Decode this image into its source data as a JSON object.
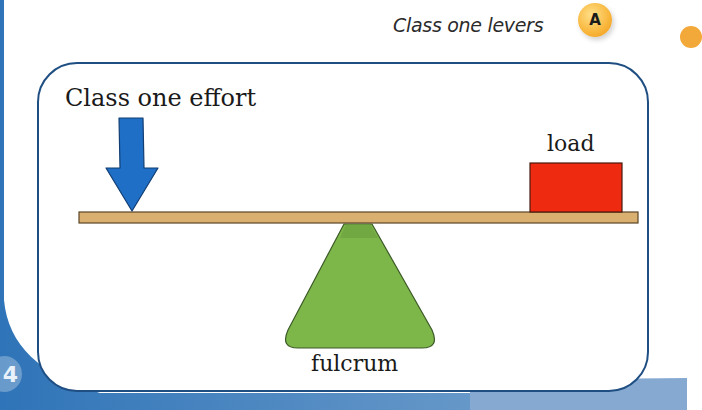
{
  "page": {
    "heading": "Class one levers",
    "section_badge": "A",
    "page_number": "4"
  },
  "diagram": {
    "title": "Class one lever",
    "labels": {
      "effort": "Class one effort",
      "load": "load",
      "fulcrum": "fulcrum"
    },
    "colors": {
      "panel_border": "#1f4f82",
      "page_blue": "#3a7dbf",
      "effort_arrow": "#1f6fc7",
      "lever_plank": "#d9b070",
      "load_box": "#ee2a10",
      "fulcrum": "#7db74a",
      "badge": "#f8b53a"
    },
    "components": [
      {
        "name": "effort arrow",
        "direction": "down",
        "position": "left end of lever"
      },
      {
        "name": "lever plank",
        "orientation": "horizontal"
      },
      {
        "name": "load",
        "shape": "red box",
        "position": "right end of lever"
      },
      {
        "name": "fulcrum",
        "shape": "green triangle",
        "position": "under lever, off-center toward middle"
      }
    ]
  }
}
